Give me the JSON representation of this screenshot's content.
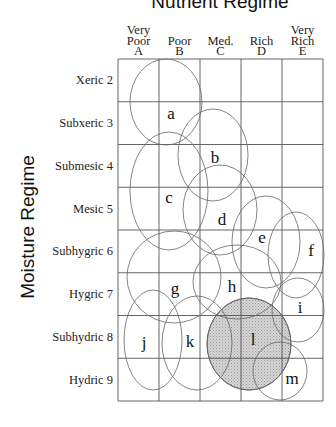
{
  "chart_data": {
    "type": "ecological-grid",
    "title": "Nutrient Regime",
    "xlabel": "Nutrient Regime",
    "ylabel": "Moisture Regime",
    "columns": [
      {
        "lines": [
          "Very",
          "Poor",
          "A"
        ],
        "code": "A"
      },
      {
        "lines": [
          "Poor",
          "B"
        ],
        "code": "B"
      },
      {
        "lines": [
          "Med.",
          "C"
        ],
        "code": "C"
      },
      {
        "lines": [
          "Rich",
          "D"
        ],
        "code": "D"
      },
      {
        "lines": [
          "Very",
          "Rich",
          "E"
        ],
        "code": "E"
      }
    ],
    "rows": [
      {
        "label": "Xeric 2",
        "code": 2
      },
      {
        "label": "Subxeric 3",
        "code": 3
      },
      {
        "label": "Submesic 4",
        "code": 4
      },
      {
        "label": "Mesic 5",
        "code": 5
      },
      {
        "label": "Subhygric 6",
        "code": 6
      },
      {
        "label": "Hygric 7",
        "code": 7
      },
      {
        "label": "Subhydric 8",
        "code": 8
      },
      {
        "label": "Hydric 9",
        "code": 9
      }
    ],
    "zones": [
      {
        "id": "a",
        "cx": 166,
        "cy": 102,
        "rx": 36,
        "ry": 43,
        "lx": 171,
        "ly": 119,
        "shaded": false
      },
      {
        "id": "b",
        "cx": 213,
        "cy": 155,
        "rx": 35,
        "ry": 46,
        "lx": 215,
        "ly": 163,
        "shaded": false
      },
      {
        "id": "c",
        "cx": 169,
        "cy": 191,
        "rx": 39,
        "ry": 59,
        "lx": 169,
        "ly": 203,
        "shaded": false
      },
      {
        "id": "d",
        "cx": 220,
        "cy": 210,
        "rx": 37,
        "ry": 45,
        "lx": 222,
        "ly": 225,
        "shaded": false
      },
      {
        "id": "e",
        "cx": 266,
        "cy": 242,
        "rx": 34,
        "ry": 46,
        "lx": 262,
        "ly": 243,
        "shaded": false
      },
      {
        "id": "f",
        "cx": 296,
        "cy": 255,
        "rx": 28,
        "ry": 43,
        "lx": 311,
        "ly": 256,
        "shaded": false
      },
      {
        "id": "g",
        "cx": 174,
        "cy": 277,
        "rx": 47,
        "ry": 46,
        "lx": 175,
        "ly": 294,
        "shaded": false
      },
      {
        "id": "h",
        "cx": 237,
        "cy": 282,
        "rx": 44,
        "ry": 37,
        "lx": 232,
        "ly": 292,
        "shaded": false
      },
      {
        "id": "i",
        "cx": 298,
        "cy": 310,
        "rx": 26,
        "ry": 32,
        "lx": 300,
        "ly": 313,
        "shaded": false
      },
      {
        "id": "j",
        "cx": 153,
        "cy": 340,
        "rx": 29,
        "ry": 50,
        "lx": 144,
        "ly": 348,
        "shaded": false
      },
      {
        "id": "k",
        "cx": 197,
        "cy": 343,
        "rx": 35,
        "ry": 47,
        "lx": 190,
        "ly": 347,
        "shaded": false
      },
      {
        "id": "l",
        "cx": 249,
        "cy": 344,
        "rx": 42,
        "ry": 46,
        "lx": 253,
        "ly": 345,
        "shaded": true
      },
      {
        "id": "m",
        "cx": 280,
        "cy": 371,
        "rx": 27,
        "ry": 29,
        "lx": 292,
        "ly": 384,
        "shaded": false
      }
    ],
    "grid": {
      "x0": 118,
      "y0": 59,
      "x1": 323,
      "y1": 401,
      "ncols": 5,
      "nrows": 8
    },
    "colors": {
      "shade": "#c8c8c8",
      "lines": "#555555",
      "background": "#ffffff"
    }
  }
}
